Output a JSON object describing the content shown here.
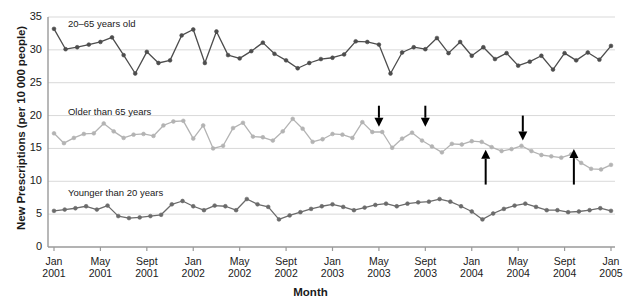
{
  "chart_data": {
    "type": "line",
    "title": "",
    "xlabel": "Month",
    "ylabel": "New Prescriptions (per 10 000 people)",
    "ylim": [
      0,
      35
    ],
    "yticks": [
      0,
      5,
      10,
      15,
      20,
      25,
      30,
      35
    ],
    "grid": "horizontal",
    "legend_position": "inline-above-series",
    "x_start": "Jan 2001",
    "x_end": "Jan 2005",
    "xticks": [
      {
        "month": "Jan",
        "year": "2001",
        "index": 0
      },
      {
        "month": "May",
        "year": "2001",
        "index": 4
      },
      {
        "month": "Sept",
        "year": "2001",
        "index": 8
      },
      {
        "month": "Jan",
        "year": "2002",
        "index": 12
      },
      {
        "month": "May",
        "year": "2002",
        "index": 16
      },
      {
        "month": "Sept",
        "year": "2002",
        "index": 20
      },
      {
        "month": "Jan",
        "year": "2003",
        "index": 24
      },
      {
        "month": "May",
        "year": "2003",
        "index": 28
      },
      {
        "month": "Sept",
        "year": "2003",
        "index": 32
      },
      {
        "month": "Jan",
        "year": "2004",
        "index": 36
      },
      {
        "month": "May",
        "year": "2004",
        "index": 40
      },
      {
        "month": "Sept",
        "year": "2004",
        "index": 44
      },
      {
        "month": "Jan",
        "year": "2005",
        "index": 48
      }
    ],
    "series": [
      {
        "name": "20-65 years old",
        "label": "20–65 years old",
        "color": "#4d4d4d",
        "label_x_index": 1.2,
        "label_y": 34.0,
        "values": [
          33.2,
          30.1,
          30.4,
          30.8,
          31.2,
          31.9,
          29.2,
          26.4,
          29.7,
          28.0,
          28.4,
          32.2,
          33.1,
          28.0,
          32.8,
          29.2,
          28.7,
          29.8,
          31.1,
          29.4,
          28.4,
          27.2,
          28.0,
          28.6,
          28.8,
          29.3,
          31.3,
          31.2,
          30.8,
          26.4,
          29.6,
          30.4,
          30.1,
          31.8,
          29.5,
          31.2,
          29.1,
          30.4,
          28.6,
          29.5,
          27.6,
          28.2,
          29.1,
          27.0,
          29.5,
          28.4,
          29.6,
          28.5,
          30.6
        ]
      },
      {
        "name": "Older than 65 years",
        "label": "Older than 65 years",
        "color": "#b3b3b3",
        "label_x_index": 1.2,
        "label_y": 20.6,
        "values": [
          17.3,
          15.8,
          16.6,
          17.2,
          17.3,
          18.8,
          17.6,
          16.6,
          17.1,
          17.2,
          16.9,
          18.5,
          19.1,
          19.2,
          16.5,
          18.5,
          15.0,
          15.4,
          18.1,
          18.9,
          16.8,
          16.7,
          16.2,
          17.6,
          19.5,
          18.0,
          16.0,
          16.4,
          17.2,
          17.1,
          16.6,
          19.0,
          17.5,
          17.5,
          15.1,
          16.5,
          17.4,
          16.2,
          15.3,
          14.4,
          15.7,
          15.6,
          16.1,
          16.0,
          15.2,
          14.6,
          14.9,
          15.4,
          14.6,
          14.0,
          13.8,
          13.6,
          14.1,
          12.8,
          11.9,
          11.8,
          12.5
        ]
      },
      {
        "name": "Younger than 20 years",
        "label": "Younger than 20 years",
        "color": "#6b6b6b",
        "label_x_index": 1.2,
        "label_y": 8.2,
        "values": [
          5.5,
          5.7,
          5.9,
          6.2,
          5.7,
          6.3,
          4.7,
          4.4,
          4.5,
          4.7,
          4.9,
          6.5,
          7.0,
          6.2,
          5.6,
          6.3,
          6.2,
          5.6,
          7.3,
          6.5,
          6.1,
          4.2,
          4.8,
          5.3,
          5.8,
          6.2,
          6.5,
          6.1,
          5.6,
          6.0,
          6.4,
          6.6,
          6.2,
          6.6,
          6.8,
          6.9,
          7.3,
          6.9,
          6.2,
          5.4,
          4.2,
          5.1,
          5.8,
          6.3,
          6.6,
          6.1,
          5.6,
          5.6,
          5.3,
          5.4,
          5.6,
          5.9,
          5.5
        ]
      }
    ],
    "annotations": [
      {
        "id": "arrow-1",
        "direction": "down",
        "x_index": 28.0,
        "y_top": 21.5,
        "y_tip": 18.3
      },
      {
        "id": "arrow-2",
        "direction": "down",
        "x_index": 32.0,
        "y_top": 21.5,
        "y_tip": 18.3
      },
      {
        "id": "arrow-3",
        "direction": "up",
        "x_index": 37.2,
        "y_bottom": 9.5,
        "y_tip": 14.8
      },
      {
        "id": "arrow-4",
        "direction": "down",
        "x_index": 40.4,
        "y_top": 20.0,
        "y_tip": 16.2
      },
      {
        "id": "arrow-5",
        "direction": "up",
        "x_index": 44.8,
        "y_bottom": 9.5,
        "y_tip": 14.9
      }
    ]
  }
}
